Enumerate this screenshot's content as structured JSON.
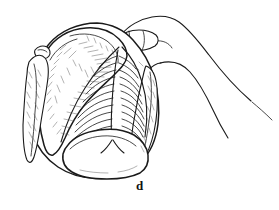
{
  "figure": {
    "panel_label": "d",
    "caption_text": "d",
    "alt_description": "Line drawing of a human hand holding an enrolled trilobite fossil, viewed from the front",
    "medium": "black-and-white line illustration",
    "background_color": "#ffffff",
    "ink_color": "#1a1a1a",
    "shade_color": "#555555",
    "subjects": [
      {
        "name": "trilobite-fossil",
        "label": "enrolled trilobite",
        "parts": [
          {
            "name": "cephalon",
            "label": "cephalon (head shield)"
          },
          {
            "name": "glabella",
            "label": "glabella"
          },
          {
            "name": "eye-tubercle",
            "label": "eye tubercle"
          },
          {
            "name": "genal-spine-left",
            "label": "left genal spine"
          },
          {
            "name": "genal-spine-right",
            "label": "right genal spine"
          },
          {
            "name": "thorax",
            "label": "thorax"
          },
          {
            "name": "axial-ridge",
            "label": "axial lobe ridge"
          },
          {
            "name": "pygidium",
            "label": "pygidium (tail shield)"
          }
        ],
        "thoracic_segment_count": 14
      },
      {
        "name": "human-hand",
        "label": "human hand",
        "parts": [
          {
            "name": "thumb",
            "label": "thumb"
          },
          {
            "name": "index-finger",
            "label": "index finger"
          },
          {
            "name": "knuckle",
            "label": "knuckle"
          },
          {
            "name": "wrist",
            "label": "wrist"
          }
        ]
      }
    ]
  }
}
